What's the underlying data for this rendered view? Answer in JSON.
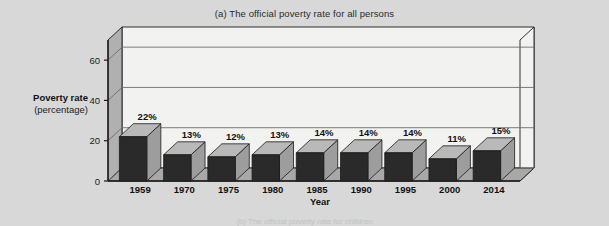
{
  "figure": {
    "title": "(a) The official poverty rate for all persons",
    "sub_caption": "(b) The official poverty rate for children",
    "y_axis_title_line1": "Poverty rate",
    "y_axis_title_line2": "(percentage)",
    "x_axis_title": "Year",
    "colors": {
      "page_background": "#d8d8d8",
      "plot_background": "#f2f2f0",
      "back_wall": "#f2f2f0",
      "side_wall": "#b0b0b0",
      "floor": "#a8a8a8",
      "bar_front": "#2a2a2a",
      "bar_top": "#b9b9b9",
      "bar_side": "#9d9d9d",
      "gridline": "#6e6e6e",
      "axis_line": "#1a1a1a",
      "text": "#111111"
    }
  },
  "chart_data": {
    "type": "bar",
    "title": "(a) The official poverty rate for all persons",
    "xlabel": "Year",
    "ylabel": "Poverty rate (percentage)",
    "categories": [
      "1959",
      "1970",
      "1975",
      "1980",
      "1985",
      "1990",
      "1995",
      "2000",
      "2014"
    ],
    "values": [
      22,
      13,
      12,
      13,
      14,
      14,
      14,
      11,
      15
    ],
    "value_labels": [
      "22%",
      "13%",
      "12%",
      "13%",
      "14%",
      "14%",
      "14%",
      "11%",
      "15%"
    ],
    "ylim": [
      0,
      70
    ],
    "yticks": [
      0,
      20,
      40,
      60
    ],
    "ytick_labels": [
      "0",
      "20",
      "40",
      "60"
    ],
    "grid": true,
    "grid_axis": "y",
    "legend": "none",
    "style": "3d-bar"
  }
}
